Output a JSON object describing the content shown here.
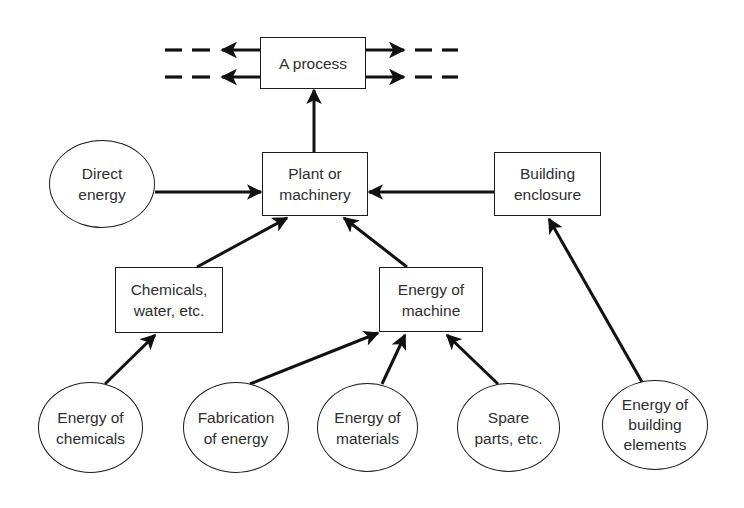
{
  "diagram": {
    "type": "flow",
    "nodes": {
      "process": {
        "shape": "box",
        "lines": [
          "A process"
        ]
      },
      "plant": {
        "shape": "box",
        "lines": [
          "Plant or",
          "machinery"
        ]
      },
      "building_enclosure": {
        "shape": "box",
        "lines": [
          "Building",
          "enclosure"
        ]
      },
      "direct_energy": {
        "shape": "ellipse",
        "lines": [
          "Direct",
          "energy"
        ]
      },
      "chemicals_water": {
        "shape": "box",
        "lines": [
          "Chemicals,",
          "water, etc."
        ]
      },
      "energy_machine": {
        "shape": "box",
        "lines": [
          "Energy of",
          "machine"
        ]
      },
      "energy_chemicals": {
        "shape": "ellipse",
        "lines": [
          "Energy of",
          "chemicals"
        ]
      },
      "fabrication_energy": {
        "shape": "ellipse",
        "lines": [
          "Fabrication",
          "of energy"
        ]
      },
      "energy_materials": {
        "shape": "ellipse",
        "lines": [
          "Energy of",
          "materials"
        ]
      },
      "spare_parts": {
        "shape": "ellipse",
        "lines": [
          "Spare",
          "parts, etc."
        ]
      },
      "energy_building_elements": {
        "shape": "ellipse",
        "lines": [
          "Energy of",
          "building",
          "elements"
        ]
      }
    },
    "edges": [
      {
        "from": "plant",
        "to": "process"
      },
      {
        "from": "direct_energy",
        "to": "plant"
      },
      {
        "from": "building_enclosure",
        "to": "plant"
      },
      {
        "from": "chemicals_water",
        "to": "plant"
      },
      {
        "from": "energy_machine",
        "to": "plant"
      },
      {
        "from": "energy_chemicals",
        "to": "chemicals_water"
      },
      {
        "from": "fabrication_energy",
        "to": "energy_machine"
      },
      {
        "from": "energy_materials",
        "to": "energy_machine"
      },
      {
        "from": "spare_parts",
        "to": "energy_machine"
      },
      {
        "from": "energy_building_elements",
        "to": "building_enclosure"
      },
      {
        "from": "process",
        "to": "outflow-left",
        "count": 2,
        "style": "dashed-continuation"
      },
      {
        "from": "process",
        "to": "outflow-right",
        "count": 2,
        "style": "dashed-continuation"
      }
    ],
    "colors": {
      "stroke": "#1c1c1c",
      "text": "#2e2e2e",
      "background": "#ffffff"
    }
  }
}
